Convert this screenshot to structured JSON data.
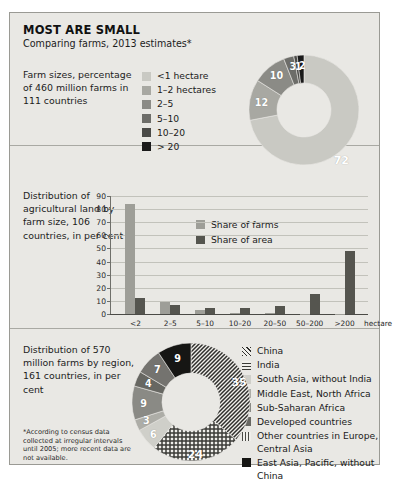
{
  "poster": {
    "title": "MOST ARE SMALL",
    "subtitle": "Comparing farms, 2013 estimates*",
    "footnote": "*According to census data collected at irregular intervals until 2005; more recent data are not available.",
    "background_color": "#e9e8e4",
    "border_color": "#9a9a94"
  },
  "section1": {
    "blurb": "Farm sizes, percentage of 460 million farms in 111 countries",
    "legend": [
      {
        "label": "<1 hectare",
        "color": "#c9c9c3"
      },
      {
        "label": "1–2 hectares",
        "color": "#a8a8a2"
      },
      {
        "label": "2–5",
        "color": "#8b8b86"
      },
      {
        "label": "5–10",
        "color": "#6d6d69"
      },
      {
        "label": "10–20",
        "color": "#4a4a47"
      },
      {
        "label": "> 20",
        "color": "#1a1a1a"
      }
    ]
  },
  "section2": {
    "blurb": "Distribution of agricultural land by farm size, 106 countries, in per cent",
    "legend": [
      {
        "label": "Share of farms",
        "color": "#9e9e98"
      },
      {
        "label": "Share of area",
        "color": "#55554f"
      }
    ]
  },
  "section3": {
    "blurb": "Distribution of 570 million farms by region, 161 countries, in per cent",
    "legend": [
      {
        "label": "China",
        "fill": "diagonal",
        "color": "#2f2f2c"
      },
      {
        "label": "India",
        "fill": "grid",
        "color": "#3a3a36"
      },
      {
        "label": "South Asia, without India",
        "fill": "solid",
        "color": "#cfcfc9"
      },
      {
        "label": "Middle East, North Africa",
        "fill": "solid",
        "color": "#adada7"
      },
      {
        "label": "Sub-Saharan Africa",
        "fill": "solid",
        "color": "#8a8a85"
      },
      {
        "label": "Developed countries",
        "fill": "solid",
        "color": "#676762"
      },
      {
        "label": "Other countries in Europe,\nCentral Asia",
        "fill": "vertical",
        "color": "#4a4a46"
      },
      {
        "label": "East Asia, Pacific, without China",
        "fill": "solid",
        "color": "#161614"
      }
    ]
  },
  "chart_data": [
    {
      "type": "pie",
      "id": "farm-sizes-donut",
      "title": "Farm sizes, percentage of 460 million farms in 111 countries",
      "unit": "per cent",
      "donut": true,
      "labels": [
        "<1 hectare",
        "1–2 hectares",
        "2–5",
        "5–10",
        "10–20",
        "> 20"
      ],
      "values": [
        72,
        12,
        10,
        3,
        1,
        2
      ],
      "colors": [
        "#c9c9c3",
        "#a8a8a2",
        "#8b8b86",
        "#6d6d69",
        "#4a4a47",
        "#1a1a1a"
      ],
      "legend_position": "left"
    },
    {
      "type": "bar",
      "id": "land-distribution-bars",
      "title": "Distribution of agricultural land by farm size, 106 countries, in per cent",
      "categories": [
        "<2",
        "2–5",
        "5–10",
        "10–20",
        "20–50",
        "50–200",
        ">200"
      ],
      "xlabel": "hectare",
      "ylabel": "",
      "ylim": [
        0,
        90
      ],
      "yticks": [
        0,
        10,
        20,
        30,
        40,
        50,
        60,
        70,
        80,
        90
      ],
      "grid": true,
      "legend_position": "inside-top-left",
      "series": [
        {
          "name": "Share of farms",
          "color": "#9e9e98",
          "values": [
            84,
            9.5,
            3,
            1,
            0.4,
            0.3,
            0.3
          ]
        },
        {
          "name": "Share of area",
          "color": "#55554f",
          "values": [
            12,
            6.5,
            4.5,
            4.5,
            6,
            15.5,
            48
          ]
        }
      ]
    },
    {
      "type": "pie",
      "id": "farms-by-region-donut",
      "title": "Distribution of 570 million farms by region, 161 countries, in per cent",
      "unit": "per cent",
      "donut": true,
      "labels": [
        "China",
        "India",
        "South Asia, without India",
        "Middle East, North Africa",
        "Sub-Saharan Africa",
        "Developed countries",
        "Other countries in Europe, Central Asia",
        "East Asia, Pacific, without China"
      ],
      "values": [
        35,
        24,
        6,
        3,
        9,
        4,
        7,
        9
      ],
      "fills": [
        "diagonal",
        "grid",
        "solid",
        "solid",
        "solid",
        "solid",
        "vertical",
        "solid"
      ],
      "colors": [
        "#2f2f2c",
        "#3a3a36",
        "#cfcfc9",
        "#adada7",
        "#8a8a85",
        "#676762",
        "#4a4a46",
        "#161614"
      ],
      "legend_position": "right"
    }
  ]
}
